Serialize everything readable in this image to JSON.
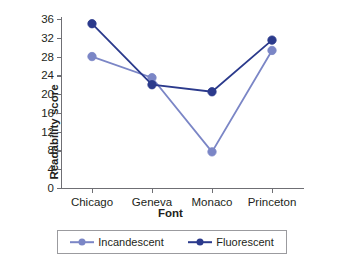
{
  "chart_data": {
    "type": "line",
    "title": "",
    "xlabel": "Font",
    "ylabel": "Readability score",
    "categories": [
      "Chicago",
      "Geneva",
      "Monaco",
      "Princeton"
    ],
    "ylim": [
      0,
      36
    ],
    "yticks": [
      0,
      4,
      8,
      12,
      16,
      20,
      24,
      28,
      32,
      36
    ],
    "ytick_labels": [
      "0",
      "4",
      "8",
      "12",
      "16",
      "20",
      "24",
      "28",
      "32",
      "36"
    ],
    "grid": false,
    "legend_position": "bottom",
    "series": [
      {
        "name": "Incandescent",
        "color": "#7b86c6",
        "values": [
          28.0,
          23.5,
          7.7,
          29.3
        ]
      },
      {
        "name": "Fluorescent",
        "color": "#2b3a8c",
        "values": [
          35.0,
          22.0,
          20.5,
          31.5
        ]
      }
    ]
  },
  "legend": {
    "entries": [
      {
        "label": "Incandescent",
        "color": "#7b86c6"
      },
      {
        "label": "Fluorescent",
        "color": "#2b3a8c"
      }
    ]
  },
  "axis": {
    "line_color": "#6f6f74"
  }
}
